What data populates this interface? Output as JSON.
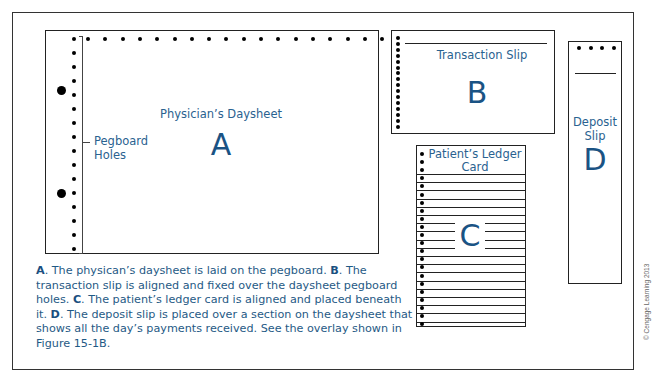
{
  "diagram": {
    "daysheet": {
      "label": "Physician’s Daysheet",
      "letter": "A"
    },
    "pegboard": {
      "label_line1": "Pegboard",
      "label_line2": "Holes"
    },
    "transaction_slip": {
      "label": "Transaction Slip",
      "letter": "B"
    },
    "ledger_card": {
      "label_line1": "Patient’s Ledger",
      "label_line2": "Card",
      "letter": "C"
    },
    "deposit_slip": {
      "label_line1": "Deposit",
      "label_line2": "Slip",
      "letter": "D"
    }
  },
  "caption": {
    "a_key": "A",
    "a_text": ". The physican’s daysheet is laid on the pegboard. ",
    "b_key": "B",
    "b_text": ". The transaction slip is aligned and fixed over the daysheet pegboard holes. ",
    "c_key": "C",
    "c_text": ". The patient’s ledger card is aligned and placed beneath it. ",
    "d_key": "D",
    "d_text": ". The deposit slip is placed over a section on the daysheet that shows all the day’s payments received. See the overlay shown in Figure 15-1B."
  },
  "copyright": "© Cengage Learning 2013",
  "colors": {
    "text_blue": "#1f5a85",
    "line": "#222222"
  }
}
